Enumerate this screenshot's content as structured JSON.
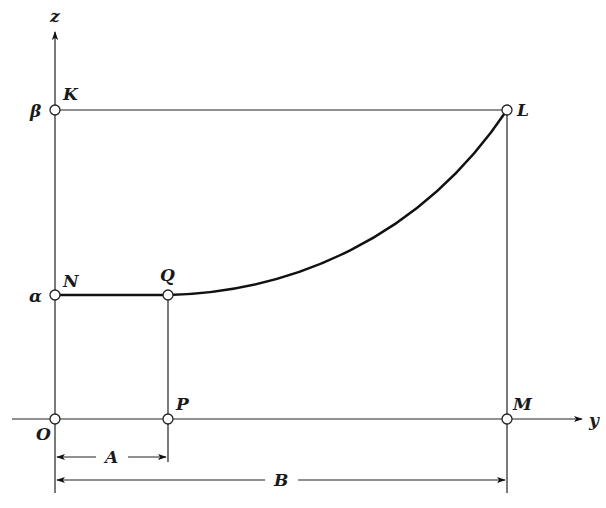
{
  "diagram": {
    "axes": {
      "vertical_label": "z",
      "horizontal_label": "y"
    },
    "axis_values": {
      "beta": "β",
      "alpha": "α"
    },
    "points": {
      "O": "O",
      "K": "K",
      "L": "L",
      "M": "M",
      "N": "N",
      "Q": "Q",
      "P": "P"
    },
    "dimensions": {
      "A": "A",
      "B": "B"
    },
    "colors": {
      "ink": "#1a1a1a",
      "background": "#ffffff"
    }
  }
}
